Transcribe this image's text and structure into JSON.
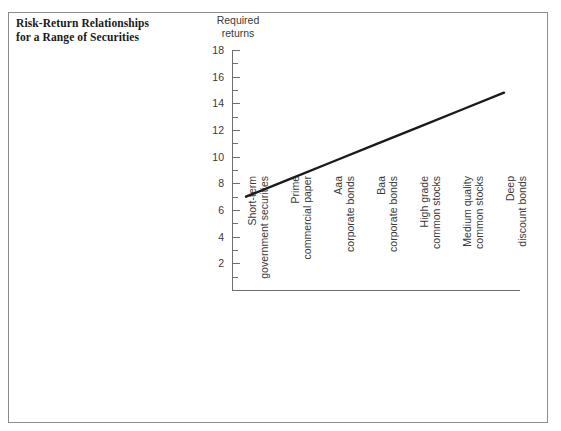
{
  "title": {
    "line1": "Risk-Return Relationships",
    "line2": "for a Range of Securities"
  },
  "chart_data": {
    "type": "line",
    "title": "Risk-Return Relationships for a Range of Securities",
    "xlabel": "",
    "ylabel": "Required returns",
    "ylabel_line1": "Required",
    "ylabel_line2": "returns",
    "ylim": [
      0,
      18
    ],
    "ytick_step": 2,
    "yticks": [
      0,
      2,
      4,
      6,
      8,
      10,
      12,
      14,
      16,
      18
    ],
    "ytick_labels": [
      "2",
      "4",
      "6",
      "8",
      "10",
      "12",
      "14",
      "16",
      "18"
    ],
    "minor_ticks": [
      1,
      3,
      5,
      7,
      9,
      11,
      13,
      15,
      17
    ],
    "grid": false,
    "legend": "none",
    "line_color": "#1a1a1a",
    "axis_color": "#6f6f6f",
    "categories": [
      "Short-term government securities",
      "Prime commercial paper",
      "Aaa corporate bonds",
      "Baa corporate bonds",
      "High grade common stocks",
      "Medium quality common stocks",
      "Deep discount bonds"
    ],
    "category_lines": [
      [
        "Short-term",
        "government securities"
      ],
      [
        "Prime",
        "commercial paper"
      ],
      [
        "Aaa",
        "corporate bonds"
      ],
      [
        "Baa",
        "corporate bonds"
      ],
      [
        "High grade",
        "common stocks"
      ],
      [
        "Medium quality",
        "common stocks"
      ],
      [
        "Deep",
        "discount bonds"
      ]
    ],
    "series": [
      {
        "name": "Required returns",
        "values": [
          7.0,
          8.3,
          9.6,
          10.9,
          12.2,
          13.5,
          14.8
        ]
      }
    ]
  }
}
